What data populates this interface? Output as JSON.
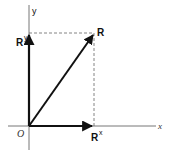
{
  "diagram": {
    "type": "vector-components",
    "axes": {
      "x_label": "x",
      "y_label": "y",
      "origin_label": "O"
    },
    "vectors": [
      {
        "name": "R",
        "label": "R",
        "from": [
          0,
          0
        ],
        "to": [
          1,
          1.4
        ]
      },
      {
        "name": "Rx",
        "label_base": "R",
        "label_sup": "x",
        "from": [
          0,
          0
        ],
        "to": [
          1,
          0
        ]
      },
      {
        "name": "Ry",
        "label_base": "R",
        "label_sup": "y",
        "from": [
          0,
          0
        ],
        "to": [
          0,
          1.4
        ]
      }
    ],
    "guides": [
      "dashed projection from R to x-axis",
      "dashed projection from R to y-axis"
    ],
    "colors": {
      "vector": "#111111",
      "axis": "#555555",
      "dashed": "#666666"
    }
  }
}
